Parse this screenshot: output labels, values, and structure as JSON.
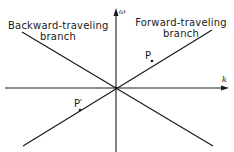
{
  "diagram": {
    "type": "dispersion-diagram",
    "axes": {
      "vertical": {
        "label": "ω"
      },
      "horizontal": {
        "label": "k"
      }
    },
    "branches": [
      {
        "id": "backward",
        "label_line1": "Backward-traveling",
        "label_line2": "branch"
      },
      {
        "id": "forward",
        "label_line1": "Forward-traveling",
        "label_line2": "branch"
      }
    ],
    "points": [
      {
        "id": "P",
        "label": "P"
      },
      {
        "id": "P-prime",
        "label": "P′"
      }
    ],
    "colors": {
      "ink": "#1a1a1a",
      "background": "#ffffff"
    }
  }
}
